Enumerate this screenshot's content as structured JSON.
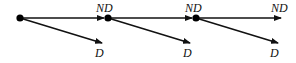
{
  "diagram": {
    "type": "decision-chain",
    "nodes": [
      {
        "id": "n1",
        "x": 20,
        "y": 18
      },
      {
        "id": "n2",
        "x": 108,
        "y": 18
      },
      {
        "id": "n3",
        "x": 196,
        "y": 18
      }
    ],
    "edges": [
      {
        "from": "n1",
        "label": "ND",
        "kind": "horizontal",
        "x2": 104,
        "y2": 18,
        "lx": 96,
        "ly": 12
      },
      {
        "from": "n1",
        "label": "D",
        "kind": "diagonal",
        "x2": 102,
        "y2": 43,
        "lx": 95,
        "ly": 57
      },
      {
        "from": "n2",
        "label": "ND",
        "kind": "horizontal",
        "x2": 192,
        "y2": 18,
        "lx": 185,
        "ly": 12
      },
      {
        "from": "n2",
        "label": "D",
        "kind": "diagonal",
        "x2": 190,
        "y2": 43,
        "lx": 183,
        "ly": 57
      },
      {
        "from": "n3",
        "label": "ND",
        "kind": "horizontal",
        "x2": 281,
        "y2": 18,
        "lx": 271,
        "ly": 12
      },
      {
        "from": "n3",
        "label": "D",
        "kind": "diagonal",
        "x2": 278,
        "y2": 43,
        "lx": 270,
        "ly": 57
      }
    ],
    "labels": {
      "no_default": "ND",
      "default": "D"
    },
    "colors": {
      "stroke": "#111111",
      "node": "#000000"
    }
  }
}
